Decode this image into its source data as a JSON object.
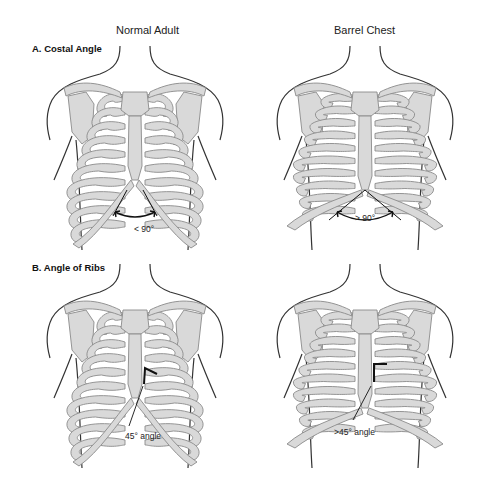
{
  "columns": [
    {
      "label": "Normal Adult"
    },
    {
      "label": "Barrel Chest"
    }
  ],
  "sections": [
    {
      "label": "A. Costal Angle"
    },
    {
      "label": "B. Angle of Ribs"
    }
  ],
  "panels": [
    {
      "id": "a-normal",
      "section": "A",
      "type": "normal",
      "annotation": "< 90°",
      "marker": "costal-arc"
    },
    {
      "id": "a-barrel",
      "section": "A",
      "type": "barrel",
      "annotation": "> 90°",
      "marker": "costal-arc"
    },
    {
      "id": "b-normal",
      "section": "B",
      "type": "normal",
      "annotation": "45° angle",
      "marker": "rib-angle"
    },
    {
      "id": "b-barrel",
      "section": "B",
      "type": "barrel",
      "annotation": ">45° angle",
      "marker": "rib-angle"
    }
  ],
  "colors": {
    "background": "#ffffff",
    "bone_fill": "#d9d9d9",
    "bone_stroke": "#8a8a8a",
    "outline": "#333333",
    "marker": "#111111"
  }
}
